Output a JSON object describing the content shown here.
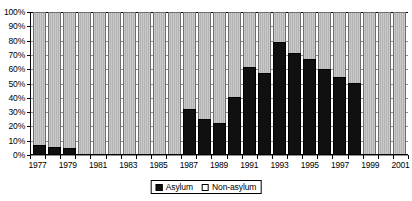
{
  "chart_data": {
    "type": "bar",
    "subtype": "stacked-100-percent",
    "title": "",
    "xlabel": "",
    "ylabel": "",
    "ylim": [
      0,
      100
    ],
    "y_ticks": [
      0,
      10,
      20,
      30,
      40,
      50,
      60,
      70,
      80,
      90,
      100
    ],
    "y_tick_labels": [
      "0%",
      "10%",
      "20%",
      "30%",
      "40%",
      "50%",
      "60%",
      "70%",
      "80%",
      "90%",
      "100%"
    ],
    "grid": true,
    "legend_position": "bottom-center",
    "categories": [
      "1977",
      "1978",
      "1979",
      "1980",
      "1981",
      "1982",
      "1983",
      "1984",
      "1985",
      "1986",
      "1987",
      "1988",
      "1989",
      "1990",
      "1991",
      "1992",
      "1993",
      "1994",
      "1995",
      "1996",
      "1997",
      "1998",
      "1999",
      "2000",
      "2001"
    ],
    "x_tick_labels": [
      "1977",
      "",
      "1979",
      "",
      "1981",
      "",
      "1983",
      "",
      "1985",
      "",
      "1987",
      "",
      "1989",
      "",
      "1991",
      "",
      "1993",
      "",
      "1995",
      "",
      "1997",
      "",
      "1999",
      "",
      "2001"
    ],
    "series": [
      {
        "name": "Asylum",
        "color": "#101010",
        "values": [
          6,
          5,
          4,
          0,
          0,
          0,
          0,
          0,
          0,
          0,
          32,
          25,
          22,
          40,
          61,
          57,
          79,
          71,
          67,
          60,
          54,
          50,
          0,
          0,
          0
        ]
      },
      {
        "name": "Non-asylum",
        "color": "#c0c0c0",
        "values": [
          94,
          95,
          96,
          100,
          100,
          100,
          100,
          100,
          100,
          100,
          68,
          75,
          78,
          60,
          39,
          43,
          21,
          29,
          33,
          40,
          46,
          50,
          100,
          100,
          100
        ]
      }
    ]
  },
  "legend": {
    "items": [
      {
        "label": "Asylum",
        "style": "filled"
      },
      {
        "label": "Non-asylum",
        "style": "hollow"
      }
    ]
  }
}
